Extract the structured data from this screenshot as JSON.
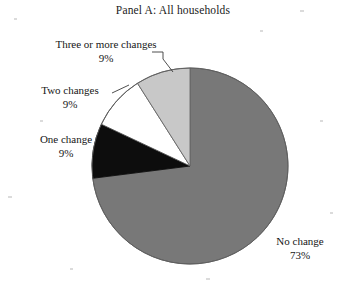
{
  "chart_data": {
    "type": "pie",
    "title": "Panel A: All households",
    "categories": [
      "No change",
      "Three or more changes",
      "Two changes",
      "One change"
    ],
    "values": [
      73,
      9,
      9,
      9
    ],
    "value_labels": [
      "73%",
      "9%",
      "9%",
      "9%"
    ],
    "colors": [
      "#787878",
      "#c8c8c8",
      "#ffffff",
      "#0d0d0d"
    ],
    "slice_outline_color": "#555555",
    "start_angle_deg": 0,
    "direction": "clockwise",
    "legend": "none",
    "grid": false,
    "slices": [
      {
        "label": "No change",
        "percent_label": "73%",
        "value": 73,
        "color": "#787878"
      },
      {
        "label": "Three or more changes",
        "percent_label": "9%",
        "value": 9,
        "color": "#c8c8c8"
      },
      {
        "label": "Two changes",
        "percent_label": "9%",
        "value": 9,
        "color": "#ffffff"
      },
      {
        "label": "One change",
        "percent_label": "9%",
        "value": 9,
        "color": "#0d0d0d"
      }
    ]
  }
}
